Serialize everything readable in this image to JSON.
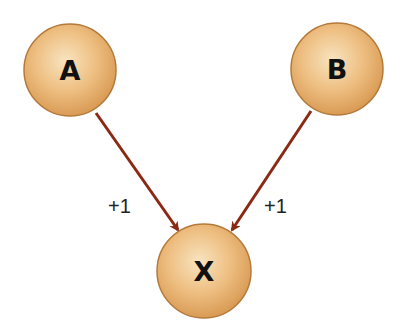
{
  "diagram": {
    "nodes": [
      {
        "id": "A",
        "label": "A",
        "cx": 70,
        "cy": 70,
        "r": 46
      },
      {
        "id": "B",
        "label": "B",
        "cx": 337,
        "cy": 69,
        "r": 46
      },
      {
        "id": "X",
        "label": "X",
        "cx": 204,
        "cy": 271,
        "r": 47
      }
    ],
    "edges": [
      {
        "from": "A",
        "to": "X",
        "label": "+1"
      },
      {
        "from": "B",
        "to": "X",
        "label": "+1"
      }
    ],
    "colors": {
      "node_fill_light": "#f6dcae",
      "node_fill_dark": "#e0a766",
      "node_stroke": "#b57a3a",
      "arrow": "#8b2a14",
      "text": "#111111"
    }
  }
}
